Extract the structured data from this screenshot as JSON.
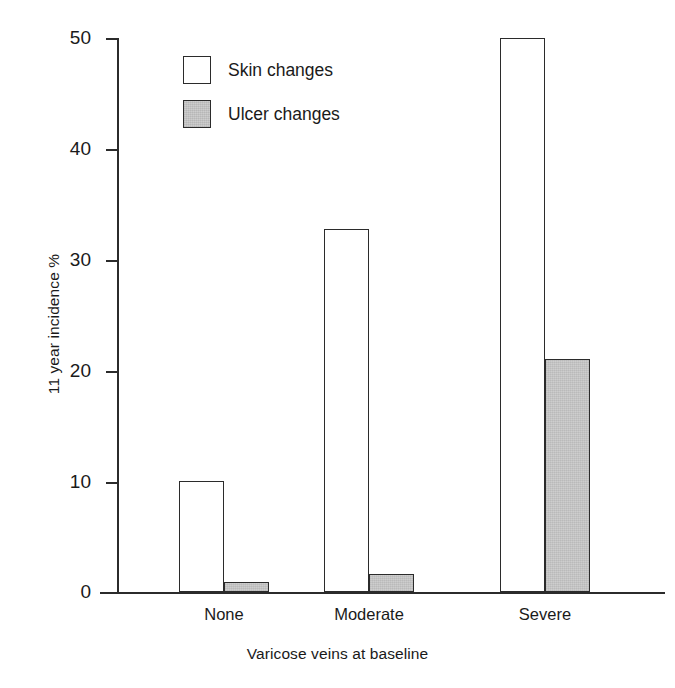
{
  "chart_data": {
    "type": "bar",
    "title": "",
    "subtitle": "",
    "xlabel": "Varicose veins at baseline",
    "ylabel": "11 year incidence %",
    "categories": [
      "None",
      "Moderate",
      "Severe"
    ],
    "series": [
      {
        "name": "Skin changes",
        "values": [
          10.0,
          32.8,
          50.0
        ],
        "fill": "#ffffff",
        "edge": "#2b2b2b"
      },
      {
        "name": "Ulcer changes",
        "values": [
          0.9,
          1.6,
          21.0
        ],
        "fill": "#c9c9c9",
        "edge": "#2b2b2b"
      }
    ],
    "ylim": [
      0,
      50
    ],
    "yticks": [
      0,
      10,
      20,
      30,
      40,
      50
    ],
    "ytick_labels": [
      "0",
      "10",
      "20",
      "30",
      "40",
      "50"
    ],
    "grid": false,
    "legend_position": "top-left-inside",
    "legend_entries": [
      "Skin changes",
      "Ulcer changes"
    ]
  },
  "axes": {
    "y_tick_labels": [
      "50",
      "40",
      "30",
      "20",
      "10",
      "0"
    ],
    "y_axis_title": "11 year incidence %",
    "x_axis_title": "Varicose veins at baseline",
    "x_group_labels": [
      "None",
      "Moderate",
      "Severe"
    ]
  },
  "legend": {
    "items": [
      {
        "label": "Skin changes",
        "swatch": "open-square-swatch"
      },
      {
        "label": "Ulcer changes",
        "swatch": "filled-square-swatch"
      }
    ]
  },
  "colors": {
    "ink": "#2b2b2b",
    "skin_fill": "#ffffff",
    "ulcer_fill": "#c9c9c9",
    "background": "#ffffff"
  }
}
